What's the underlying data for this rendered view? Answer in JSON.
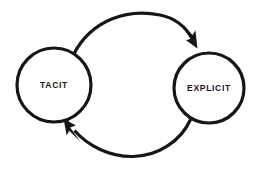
{
  "diagram": {
    "background_color": "#ffffff",
    "stroke_color": "#161616",
    "text_color": "#1a1a1a",
    "nodes": [
      {
        "id": "tacit",
        "label": "TACIT",
        "shape": "circle",
        "cx": 54,
        "cy": 85,
        "r": 37
      },
      {
        "id": "explicit",
        "label": "EXPLICIT",
        "shape": "circle",
        "cx": 209,
        "cy": 88,
        "r": 35
      }
    ],
    "edges": [
      {
        "id": "tacit-to-explicit",
        "from": "tacit",
        "to": "explicit",
        "label": "",
        "direction": "clockwise-top",
        "arrowhead": "solid-triangle",
        "arrowhead_points_to": "top of explicit circle"
      },
      {
        "id": "explicit-to-tacit",
        "from": "explicit",
        "to": "tacit",
        "label": "",
        "direction": "counterclockwise-bottom",
        "arrowhead": "solid-triangle",
        "arrowhead_points_to": "bottom of tacit circle"
      }
    ]
  }
}
